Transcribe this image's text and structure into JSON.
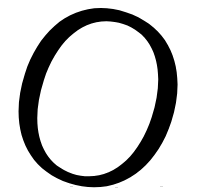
{
  "glyph": {
    "character": "O",
    "style": "italic serif",
    "color": "#000000",
    "background": "#ffffff"
  }
}
